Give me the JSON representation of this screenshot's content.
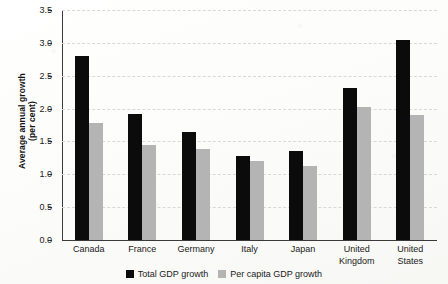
{
  "chart_data": {
    "type": "bar",
    "title": "",
    "xlabel": "",
    "ylabel": "Average annual growth\n(per cent)",
    "ylabel_line1": "Average annual growth",
    "ylabel_line2": "(per cent)",
    "categories": [
      "Canada",
      "France",
      "Germany",
      "Italy",
      "Japan",
      "United Kingdom",
      "United States"
    ],
    "category_lines": [
      [
        "Canada"
      ],
      [
        "France"
      ],
      [
        "Germany"
      ],
      [
        "Italy"
      ],
      [
        "Japan"
      ],
      [
        "United",
        "Kingdom"
      ],
      [
        "United",
        "States"
      ]
    ],
    "series": [
      {
        "name": "Total GDP growth",
        "color": "#0b0b0b",
        "values": [
          2.8,
          1.92,
          1.65,
          1.28,
          1.36,
          2.32,
          3.05
        ]
      },
      {
        "name": "Per capita GDP growth",
        "color": "#b4b4b4",
        "values": [
          1.78,
          1.45,
          1.38,
          1.21,
          1.12,
          2.02,
          1.9
        ]
      }
    ],
    "ylim": [
      0.0,
      3.5
    ],
    "ytick_step": 0.5,
    "yticks": [
      "0.0",
      "0.5",
      "1.0",
      "1.5",
      "2.0",
      "2.5",
      "3.0",
      "3.5"
    ],
    "ytick_values": [
      0.0,
      0.5,
      1.0,
      1.5,
      2.0,
      2.5,
      3.0,
      3.5
    ],
    "grid": true,
    "grid_style": "dashed",
    "grid_color": "#d8d8d6",
    "legend_position": "bottom-center",
    "legend": [
      "Total GDP growth",
      "Per capita GDP growth"
    ],
    "background_color": "#fdfdfb",
    "axis_color": "#3a3a3a"
  }
}
